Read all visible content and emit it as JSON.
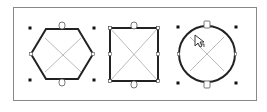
{
  "canvas": {
    "frame": {
      "x": 13,
      "y": 7,
      "width": 244,
      "height": 94,
      "stroke": "#888888"
    },
    "colors": {
      "shape_stroke": "#222222",
      "diagonal": "#999999",
      "handle": "#111111",
      "connector": "#555555"
    },
    "shapes": [
      {
        "name": "hexagon",
        "type": "hexagon",
        "cx": 62,
        "cy": 54,
        "selected": true
      },
      {
        "name": "rectangle",
        "type": "rectangle",
        "cx": 134,
        "cy": 54,
        "selected": true
      },
      {
        "name": "circle",
        "type": "circle",
        "cx": 207,
        "cy": 54,
        "selected": true
      }
    ],
    "cursor": {
      "type": "move-pointer-icon",
      "x": 195,
      "y": 35
    }
  }
}
